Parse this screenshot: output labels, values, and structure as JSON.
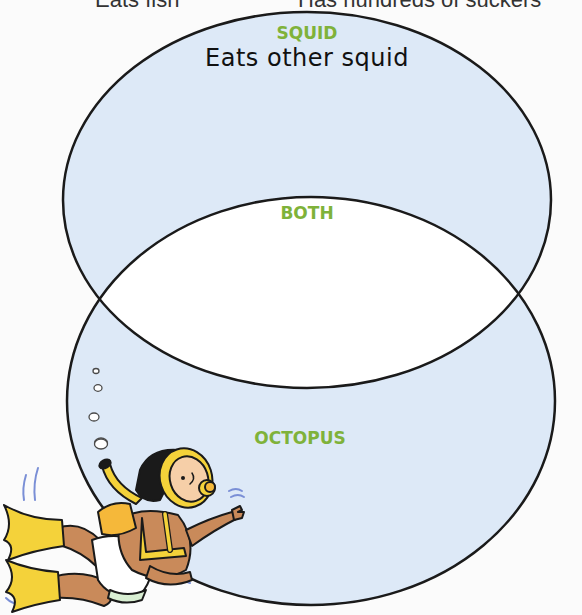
{
  "colors": {
    "background": "#fbfbfb",
    "circle_fill": "#dde9f7",
    "overlap_fill": "#ffffff",
    "outline": "#1a1a1a",
    "label_green": "#7fb23a"
  },
  "top_cropped_text": {
    "left": "Eats fish",
    "right": "Has hundreds of suckers"
  },
  "venn": {
    "top_set": {
      "label": "SQUID",
      "entries": [
        "Eats other squid"
      ]
    },
    "overlap": {
      "label": "BOTH",
      "entries": []
    },
    "bottom_set": {
      "label": "OCTOPUS",
      "entries": []
    }
  },
  "illustration": {
    "subject": "cartoon scuba diver with snorkel and flippers",
    "bubbles": 5
  }
}
